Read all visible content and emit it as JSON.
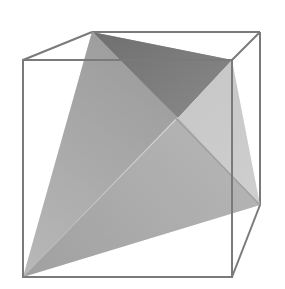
{
  "figure": {
    "title": "",
    "colors": {
      "background": "#ffffff",
      "cube_edge": "#7a7a7a",
      "face_left_front": "#a9a9a9",
      "face_top_back": "#7d7d7d",
      "face_right": "#c4c4c4",
      "face_bottom_front": "#8f8f8f",
      "tetra_edge": "#9a9a9a"
    }
  }
}
